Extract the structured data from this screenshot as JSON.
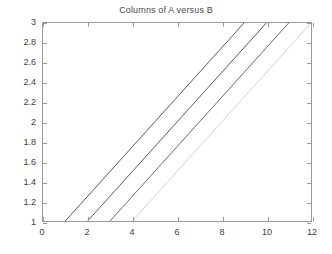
{
  "figure": {
    "background_color": "#ffffff",
    "axes_color": "#9a9a9a",
    "text_color": "#3d3d3d"
  },
  "chart_data": {
    "type": "line",
    "title": "Columns of A versus B",
    "xlabel": "",
    "ylabel": "",
    "xlim": [
      0,
      12
    ],
    "ylim": [
      1,
      3
    ],
    "grid": false,
    "legend": null,
    "xticks": [
      0,
      2,
      4,
      6,
      8,
      10,
      12
    ],
    "xticklabels": [
      "0",
      "2",
      "4",
      "6",
      "8",
      "10",
      "12"
    ],
    "yticks": [
      1,
      1.2,
      1.4,
      1.6,
      1.8,
      2,
      2.2,
      2.4,
      2.6,
      2.8,
      3
    ],
    "yticklabels": [
      "1",
      "1.2",
      "1.4",
      "1.6",
      "1.8",
      "2",
      "2.2",
      "2.4",
      "2.6",
      "2.8",
      "3"
    ],
    "series": [
      {
        "name": "column 1",
        "color": "#5a5a5a",
        "x": [
          1,
          9
        ],
        "y": [
          1,
          3
        ]
      },
      {
        "name": "column 2",
        "color": "#5a5a5a",
        "x": [
          2,
          10
        ],
        "y": [
          1,
          3
        ]
      },
      {
        "name": "column 3",
        "color": "#6a6a6a",
        "x": [
          3,
          11
        ],
        "y": [
          1,
          3
        ]
      },
      {
        "name": "column 4",
        "color": "#d2d2d2",
        "x": [
          4,
          12
        ],
        "y": [
          1,
          3
        ]
      }
    ]
  }
}
